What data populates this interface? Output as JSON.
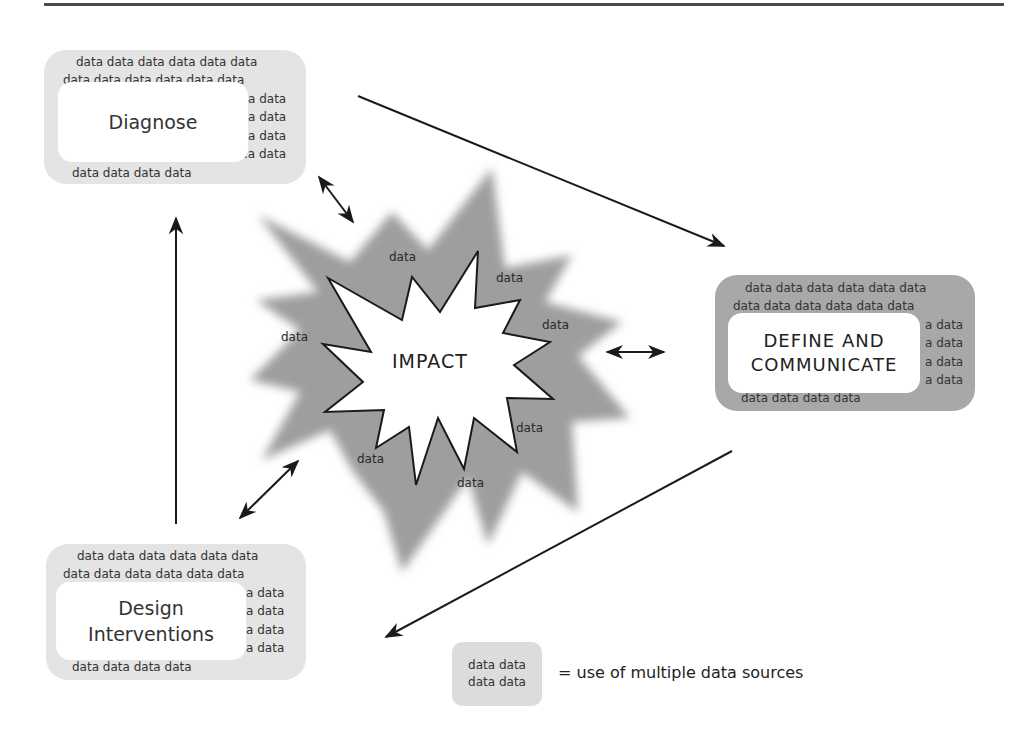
{
  "diagram": {
    "center": {
      "label": "IMPACT",
      "data_words": [
        "data",
        "data",
        "data",
        "data",
        "data",
        "data",
        "data",
        "data"
      ]
    },
    "nodes": [
      {
        "id": "diagnose",
        "label_lines": [
          "Diagnose"
        ],
        "shade": "light",
        "data_rows": [
          "data data data data data data",
          "data  data  data  data  data  data",
          "a data",
          "a data",
          "a data",
          ".a data",
          "data data data data"
        ]
      },
      {
        "id": "define",
        "label_lines": [
          "DEFINE AND",
          "COMMUNICATE"
        ],
        "shade": "dark",
        "data_rows": [
          "data data data data data data",
          "data  data  data  data  data  data",
          "a data",
          "a data",
          "a data",
          "a data",
          "data data data data"
        ]
      },
      {
        "id": "design",
        "label_lines": [
          "Design",
          "Interventions"
        ],
        "shade": "light",
        "data_rows": [
          "data data data data data data",
          "data  data  data  data  data  data",
          ":a data",
          ":a data",
          ":a data",
          ":a data",
          "data data data data"
        ]
      }
    ],
    "flow_arrows": [
      {
        "from": "diagnose",
        "to": "define"
      },
      {
        "from": "define",
        "to": "design"
      },
      {
        "from": "design",
        "to": "diagnose"
      }
    ],
    "bidirectional_arrows": [
      {
        "between": [
          "diagnose",
          "impact"
        ]
      },
      {
        "between": [
          "define",
          "impact"
        ]
      },
      {
        "between": [
          "design",
          "impact"
        ]
      }
    ],
    "legend": {
      "swatch_lines": [
        "data data",
        "data data"
      ],
      "text": "= use of multiple data sources"
    },
    "colors": {
      "light_box": "#e4e4e4",
      "dark_box": "#a8a8a8",
      "outer_star": "#9e9e9e",
      "line": "#1a1a1a"
    }
  }
}
